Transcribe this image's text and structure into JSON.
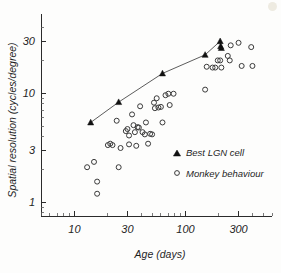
{
  "chart_data": {
    "type": "scatter",
    "title": "",
    "xlabel": "Age (days)",
    "ylabel": "Spatial resolution (cycles/degree)",
    "xscale": "log",
    "yscale": "log",
    "xlim": [
      5,
      600
    ],
    "ylim": [
      0.75,
      45
    ],
    "grid": false,
    "xticks": [
      10,
      30,
      100,
      300
    ],
    "xtick_labels": [
      "10",
      "30",
      "100",
      "300"
    ],
    "yticks": [
      1,
      3,
      10,
      30
    ],
    "ytick_labels": [
      "1",
      "3",
      "10",
      "30"
    ],
    "legend_position": "lower-right",
    "series": [
      {
        "name": "Best LGN cell",
        "marker": "filled-triangle",
        "connected": true,
        "color": "#111111",
        "points": [
          [
            14,
            5.4
          ],
          [
            25,
            8.3
          ],
          [
            62,
            15.2
          ],
          [
            150,
            22.5
          ],
          [
            205,
            30.0
          ],
          [
            207,
            27.0
          ],
          [
            210,
            26.0
          ]
        ]
      },
      {
        "name": "Monkey behaviour",
        "marker": "open-circle",
        "connected": false,
        "color": "#3a3a3a",
        "points": [
          [
            13,
            2.1
          ],
          [
            15,
            2.35
          ],
          [
            16,
            1.55
          ],
          [
            16,
            1.2
          ],
          [
            20,
            3.35
          ],
          [
            21,
            3.45
          ],
          [
            22,
            3.35
          ],
          [
            24,
            5.6
          ],
          [
            25,
            2.1
          ],
          [
            26,
            3.15
          ],
          [
            29,
            4.5
          ],
          [
            30,
            4.7
          ],
          [
            31,
            4.1
          ],
          [
            31,
            3.4
          ],
          [
            33,
            6.4
          ],
          [
            34,
            5.1
          ],
          [
            35,
            4.4
          ],
          [
            36,
            3.3
          ],
          [
            37,
            4.9
          ],
          [
            38,
            4.85
          ],
          [
            39,
            7.6
          ],
          [
            41,
            4.4
          ],
          [
            43,
            4.2
          ],
          [
            44,
            5.4
          ],
          [
            46,
            3.45
          ],
          [
            48,
            4.25
          ],
          [
            50,
            4.2
          ],
          [
            52,
            8.2
          ],
          [
            53,
            7.3
          ],
          [
            55,
            9.0
          ],
          [
            57,
            7.4
          ],
          [
            60,
            7.5
          ],
          [
            62,
            5.4
          ],
          [
            66,
            9.6
          ],
          [
            70,
            9.9
          ],
          [
            72,
            7.8
          ],
          [
            78,
            9.9
          ],
          [
            150,
            10.8
          ],
          [
            155,
            17.5
          ],
          [
            175,
            17.2
          ],
          [
            185,
            17.2
          ],
          [
            195,
            20.0
          ],
          [
            205,
            20.0
          ],
          [
            210,
            17.2
          ],
          [
            240,
            22.0
          ],
          [
            250,
            20.0
          ],
          [
            255,
            27.5
          ],
          [
            300,
            29.0
          ],
          [
            320,
            17.8
          ],
          [
            390,
            26.5
          ],
          [
            400,
            17.8
          ]
        ]
      }
    ]
  },
  "axes": {
    "x_title": "Age (days)",
    "y_title": "Spatial resolution (cycles/degree)"
  },
  "legend": {
    "entries": [
      {
        "label": "Best LGN cell",
        "marker": "filled-triangle"
      },
      {
        "label": "Monkey behaviour",
        "marker": "open-circle"
      }
    ]
  }
}
